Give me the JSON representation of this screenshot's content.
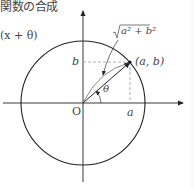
{
  "header": {
    "text": "関数の合成"
  },
  "formula_fragment": "(x + θ)",
  "diagram": {
    "type": "unit-circle-synthesis",
    "labels": {
      "b": "b",
      "point": "(a, b)",
      "a": "a",
      "origin": "O",
      "theta": "θ",
      "radius": "a² + b²"
    },
    "colors": {
      "stroke": "#222222",
      "dashed": "#999999",
      "text": "#444444"
    }
  }
}
